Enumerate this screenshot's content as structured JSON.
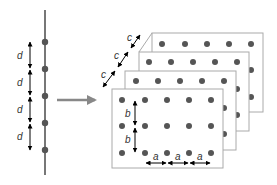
{
  "diagram": {
    "chain": {
      "spacing_label": "d",
      "atom_count": 5,
      "labels": [
        "d",
        "d",
        "d",
        "d"
      ]
    },
    "transform_arrow": {
      "direction": "right"
    },
    "lattice": {
      "plane_count": 4,
      "rows_per_plane": 3,
      "cols_per_plane": 5,
      "a_labels": [
        "a",
        "a",
        "a"
      ],
      "b_labels": [
        "b",
        "b"
      ],
      "c_labels": [
        "c",
        "c",
        "c"
      ]
    },
    "colors": {
      "atom": "#555555",
      "line": "#777777",
      "plane_border": "#aaaaaa",
      "arrow_gray": "#888888",
      "dimension_arrow": "#000000"
    }
  }
}
